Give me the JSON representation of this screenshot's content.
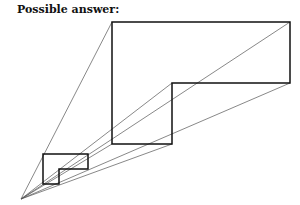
{
  "title": "Possible answer:",
  "diagram": {
    "apex": [
      21,
      199
    ],
    "large_shape": [
      [
        112,
        22
      ],
      [
        290,
        22
      ],
      [
        290,
        83
      ],
      [
        172,
        83
      ],
      [
        172,
        144
      ],
      [
        112,
        144
      ]
    ],
    "small_shape": [
      [
        43,
        154
      ],
      [
        88,
        154
      ],
      [
        88,
        169
      ],
      [
        59,
        169
      ],
      [
        59,
        184
      ],
      [
        43,
        184
      ]
    ],
    "colors": {
      "stroke": "#111111",
      "rays": "#555555"
    }
  }
}
